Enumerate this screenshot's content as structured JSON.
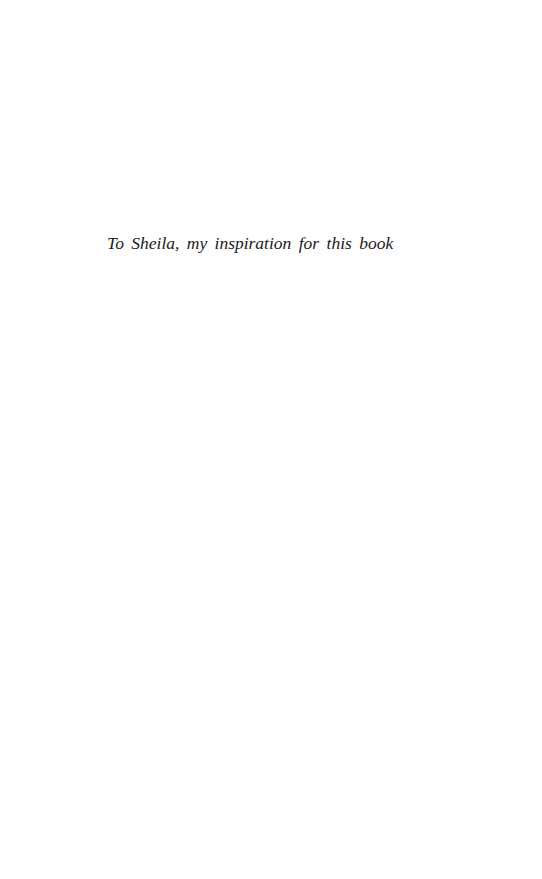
{
  "page": {
    "dedication": "To Sheila, my inspiration for this book"
  }
}
